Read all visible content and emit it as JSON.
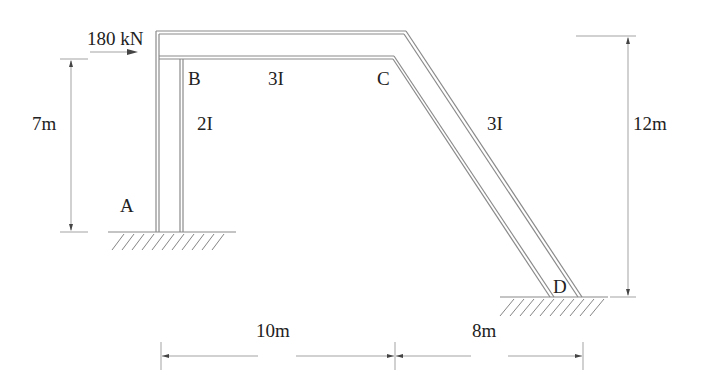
{
  "diagram": {
    "type": "structural frame",
    "load": {
      "label": "180 kN",
      "direction": "right",
      "at": "B (top left)"
    },
    "nodes": [
      {
        "id": "A",
        "label": "A",
        "support": "fixed"
      },
      {
        "id": "B",
        "label": "B"
      },
      {
        "id": "C",
        "label": "C"
      },
      {
        "id": "D",
        "label": "D",
        "support": "fixed"
      }
    ],
    "members": [
      {
        "from": "A",
        "to": "B",
        "stiffness": "2I"
      },
      {
        "from": "B",
        "to": "C",
        "stiffness": "3I"
      },
      {
        "from": "C",
        "to": "D",
        "stiffness": "3I"
      }
    ],
    "dimensions": {
      "left_height": "7m",
      "right_height": "12m",
      "span_bc": "10m",
      "span_cd": "8m"
    }
  }
}
